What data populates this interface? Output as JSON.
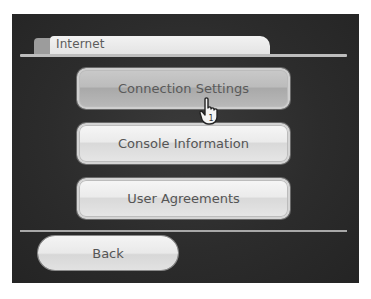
{
  "header": {
    "tab_label": "Internet"
  },
  "menu": {
    "items": [
      {
        "label": "Connection Settings",
        "selected": true
      },
      {
        "label": "Console Information",
        "selected": false
      },
      {
        "label": "User Agreements",
        "selected": false
      }
    ]
  },
  "footer": {
    "back_label": "Back"
  },
  "cursor": {
    "icon": "pointing-hand-icon",
    "player_number": "1"
  },
  "colors": {
    "background": "#2c2c2c",
    "button_face": "#ebebeb",
    "button_selected": "#bcbcbc",
    "text": "#555555"
  }
}
